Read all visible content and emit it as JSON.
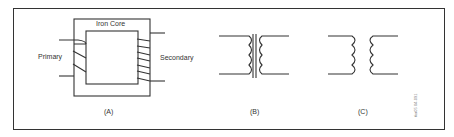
{
  "diagram": {
    "panel_a": {
      "core_label": "Iron Core",
      "primary_label": "Primary",
      "secondary_label": "Secondary",
      "caption": "(A)"
    },
    "panel_b": {
      "caption": "(B)"
    },
    "panel_c": {
      "caption": "(C)"
    },
    "figure_code": "tka05 04-091",
    "colors": {
      "line": "#333333",
      "background": "#ffffff"
    }
  }
}
